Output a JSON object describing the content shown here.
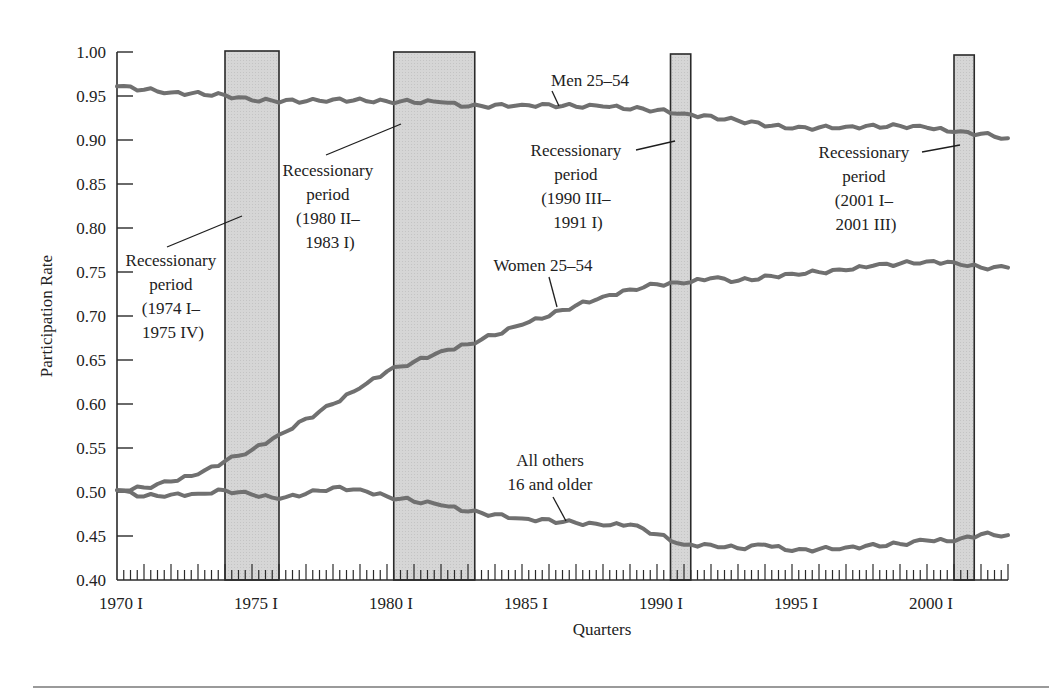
{
  "chart_data": {
    "type": "line",
    "title": "",
    "xlabel": "Quarters",
    "ylabel": "Participation Rate",
    "ylim": [
      0.4,
      1.0
    ],
    "xlim": [
      "1970 I",
      "2003 I"
    ],
    "grid": false,
    "legend": "inline labels",
    "y_ticks": [
      "0.40",
      "0.45",
      "0.50",
      "0.55",
      "0.60",
      "0.65",
      "0.70",
      "0.75",
      "0.80",
      "0.85",
      "0.90",
      "0.95",
      "1.00"
    ],
    "x_tick_labels": [
      "1970 I",
      "1975 I",
      "1980 I",
      "1985 I",
      "1990 I",
      "1995 I",
      "2000 I"
    ],
    "series": [
      {
        "name": "Men 25–54",
        "x": [
          1970,
          1972,
          1974,
          1975,
          1977,
          1978,
          1980,
          1982,
          1983,
          1985,
          1988,
          1990,
          1991,
          1993,
          1995,
          1997,
          1999,
          2000,
          2001,
          2002,
          2003
        ],
        "values": [
          0.961,
          0.954,
          0.951,
          0.945,
          0.944,
          0.946,
          0.944,
          0.943,
          0.938,
          0.94,
          0.938,
          0.934,
          0.93,
          0.922,
          0.913,
          0.915,
          0.916,
          0.914,
          0.909,
          0.907,
          0.902
        ]
      },
      {
        "name": "Women 25–54",
        "x": [
          1970,
          1971,
          1972,
          1973,
          1974,
          1975,
          1976,
          1978,
          1979,
          1980,
          1981,
          1982,
          1983,
          1985,
          1987,
          1988,
          1989,
          1990,
          1991,
          1992,
          1993,
          1995,
          1997,
          1998,
          2000,
          2001,
          2002,
          2003
        ],
        "values": [
          0.502,
          0.505,
          0.512,
          0.52,
          0.535,
          0.548,
          0.565,
          0.6,
          0.618,
          0.637,
          0.648,
          0.66,
          0.668,
          0.69,
          0.712,
          0.722,
          0.73,
          0.736,
          0.737,
          0.743,
          0.74,
          0.748,
          0.752,
          0.757,
          0.762,
          0.761,
          0.755,
          0.755
        ]
      },
      {
        "name": "All others 16 and older",
        "x": [
          1970,
          1971,
          1972,
          1973,
          1974,
          1975,
          1976,
          1977,
          1978,
          1979,
          1980,
          1982,
          1983,
          1985,
          1987,
          1988,
          1989,
          1990,
          1991,
          1992,
          1993,
          1994,
          1995,
          1997,
          1999,
          2000,
          2001,
          2002,
          2003
        ],
        "values": [
          0.502,
          0.495,
          0.497,
          0.498,
          0.502,
          0.497,
          0.492,
          0.498,
          0.505,
          0.503,
          0.495,
          0.485,
          0.478,
          0.47,
          0.465,
          0.462,
          0.463,
          0.452,
          0.44,
          0.44,
          0.436,
          0.44,
          0.433,
          0.437,
          0.441,
          0.445,
          0.444,
          0.452,
          0.451
        ]
      }
    ],
    "recessions": [
      {
        "start": 1974.0,
        "end": 1976.0,
        "label": [
          "Recessionary",
          "period",
          "(1974 I–",
          "1975 IV)"
        ]
      },
      {
        "start": 1980.25,
        "end": 1983.25,
        "label": [
          "Recessionary",
          "period",
          "(1980 II–",
          "1983 I)"
        ]
      },
      {
        "start": 1990.5,
        "end": 1991.25,
        "label": [
          "Recessionary",
          "period",
          "(1990 III–",
          "1991 I)"
        ]
      },
      {
        "start": 2001.0,
        "end": 2001.75,
        "label": [
          "Recessionary",
          "period",
          "(2001 I–",
          "2001 III)"
        ]
      }
    ],
    "annotations": [
      "Men 25–54",
      "Women 25–54",
      "All others",
      "16 and older"
    ]
  },
  "labels": {
    "ylabel": "Participation Rate",
    "xlabel": "Quarters",
    "men": "Men 25–54",
    "women": "Women 25–54",
    "others_1": "All others",
    "others_2": "16 and older",
    "rec1": [
      "Recessionary",
      "period",
      "(1974 I–",
      "1975 IV)"
    ],
    "rec2": [
      "Recessionary",
      "period",
      "(1980 II–",
      "1983 I)"
    ],
    "rec3": [
      "Recessionary",
      "period",
      "(1990 III–",
      "1991 I)"
    ],
    "rec4": [
      "Recessionary",
      "period",
      "(2001 I–",
      "2001 III)"
    ],
    "y_ticks": [
      "1.00",
      "0.95",
      "0.90",
      "0.85",
      "0.80",
      "0.75",
      "0.70",
      "0.65",
      "0.60",
      "0.55",
      "0.50",
      "0.45",
      "0.40"
    ],
    "x_ticks": [
      "1970 I",
      "1975 I",
      "1980 I",
      "1985 I",
      "1990 I",
      "1995 I",
      "2000 I"
    ]
  },
  "colors": {
    "line": "#707070",
    "recession_fill": "#d4d4d4",
    "axis": "#2a2a2a"
  }
}
